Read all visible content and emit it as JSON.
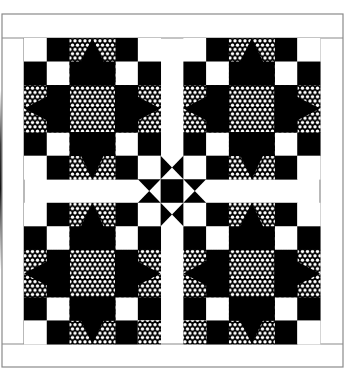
{
  "colors": {
    "background": "#ffffff",
    "dark": "#000000",
    "light": "#ffffff",
    "border_line": "#8a8a8a",
    "dot_fabric_bg": "#000000",
    "dot_fabric_dot": "#ffffff"
  },
  "layout": {
    "outer_border": {
      "x": 2,
      "y": 14,
      "right": 343,
      "bottom": 367
    },
    "quilt_area": {
      "x": 24,
      "y": 38,
      "right": 320,
      "bottom": 344
    },
    "block_grid": 6,
    "unit_w": 22.77,
    "unit_h": 23.5,
    "sashing_units": 1
  },
  "blocks": [
    {
      "name": "block-top-left",
      "col": 0,
      "row": 0,
      "variant_patches": []
    },
    {
      "name": "block-top-right",
      "col": 1,
      "row": 0,
      "variant_patches": []
    },
    {
      "name": "block-bottom-left",
      "col": 0,
      "row": 1,
      "variant_patches": [
        {
          "r": 5,
          "c": 5,
          "fill": "dots"
        }
      ]
    },
    {
      "name": "block-bottom-right",
      "col": 1,
      "row": 1,
      "variant_patches": [
        {
          "r": 5,
          "c": 0,
          "fill": "dots"
        }
      ]
    }
  ],
  "block_template": {
    "corner_checker": [
      [
        "light",
        "dark"
      ],
      [
        "dark",
        "light"
      ]
    ],
    "center_fill": "dots",
    "point_background": "dots",
    "point_fill": "dark"
  },
  "cornerstone": {
    "fill": "dark",
    "star_points": [
      "hourglass-vertical-above",
      "hourglass-vertical-below",
      "hourglass-horizontal-left",
      "hourglass-horizontal-right"
    ]
  },
  "caption": "Star quilt: four star blocks with sashing and center star"
}
